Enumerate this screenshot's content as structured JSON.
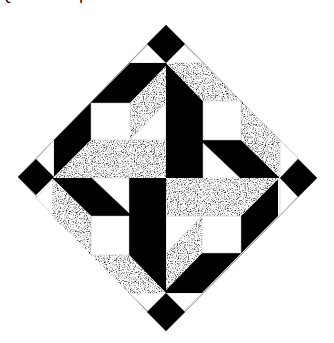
{
  "figure": {
    "title": "Quilt block pattern",
    "colors": {
      "black": "#000000",
      "white": "#ffffff",
      "speckle_base": "#9a9a9a",
      "outline": "#8a8a8a"
    },
    "center": [
      166,
      178
    ],
    "corner_diamonds": [
      {
        "name": "top",
        "points": "166,25 185,44 166,63 147,44"
      },
      {
        "name": "left",
        "points": "18,177 36,159 54,177 36,195"
      },
      {
        "name": "right",
        "points": "280,178 298,159 317,178 298,197"
      },
      {
        "name": "bottom",
        "points": "166,293 185,312 166,331 147,312"
      }
    ],
    "outer_triangles": [
      "130,63 148,45 166,63",
      "166,63 184,45 203,63",
      "280,140 298,158 280,178",
      "280,178 298,196 280,215",
      "202,293 184,311 166,293",
      "166,293 148,311 129,293",
      "54,216 36,198 54,178",
      "54,178 36,160 54,140"
    ],
    "quadrants": {
      "top_left": {
        "black": "54,140 130,63 166,63 166,66 130,103 91,103 91,140 54,177",
        "speckle": [
          "166,66 166,103 130,140 130,103",
          "54,177 91,140 166,140 166,178 54,178"
        ],
        "white": [
          "91,103 130,103 130,140 91,140",
          "166,103 166,140 130,140"
        ]
      },
      "top_right": {
        "black": "166,63 203,101 203,140 241,140 280,178 166,178",
        "speckle": [
          "166,63 203,63 280,140 280,178 241,140 241,101 203,101"
        ],
        "white": [
          "203,101 241,101 241,140 203,140",
          "203,143 203,178 240,178"
        ]
      }
    }
  }
}
